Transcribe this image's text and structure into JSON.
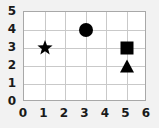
{
  "chart_data": {
    "type": "scatter",
    "title": "",
    "xlabel": "",
    "ylabel": "",
    "xlim": [
      0,
      6
    ],
    "ylim": [
      0,
      5
    ],
    "grid": true,
    "legend": false,
    "xticks": [
      "0",
      "1",
      "2",
      "3",
      "4",
      "5",
      "6"
    ],
    "yticks": [
      "0",
      "1",
      "2",
      "3",
      "4",
      "5"
    ],
    "marker_color": "#000000",
    "grid_color": "#c9c9c9",
    "border_color": "#a8a8a8",
    "background": "#ffffff",
    "points": [
      {
        "label": "star",
        "marker": "star",
        "x": 1,
        "y": 3
      },
      {
        "label": "circle",
        "marker": "circle",
        "x": 3,
        "y": 4
      },
      {
        "label": "square",
        "marker": "square",
        "x": 5,
        "y": 3
      },
      {
        "label": "triangle",
        "marker": "triangle",
        "x": 5,
        "y": 2
      }
    ]
  }
}
